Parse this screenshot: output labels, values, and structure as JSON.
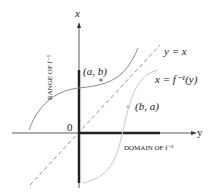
{
  "diagram": {
    "axes": {
      "vertical_label": "x",
      "horizontal_label": "y",
      "origin_label": "0"
    },
    "curves": [
      {
        "name": "f",
        "color": "#8a8a8a"
      },
      {
        "name": "f_inverse",
        "label": "x = f⁻¹(y)",
        "color": "#c8c8c8"
      }
    ],
    "diagonal": {
      "label": "y = x",
      "style": "dashed",
      "color": "#777777"
    },
    "points": [
      {
        "label": "(a, b)"
      },
      {
        "label": "(b, a)"
      }
    ],
    "range_label": "RANGE OF f⁻¹",
    "domain_label": "DOMAIN OF f⁻¹"
  }
}
